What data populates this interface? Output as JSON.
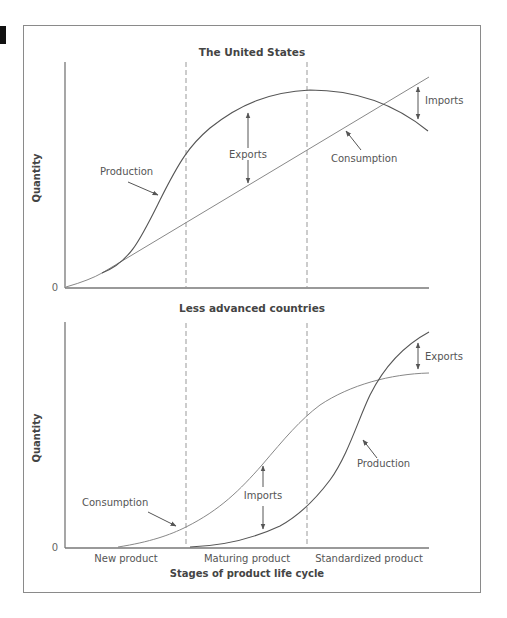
{
  "figure": {
    "top_panel": {
      "title": "The United States",
      "y_label": "Quantity",
      "origin_label": "0",
      "labels": {
        "production": "Production",
        "consumption": "Consumption",
        "exports": "Exports",
        "imports": "Imports"
      }
    },
    "bottom_panel": {
      "title": "Less advanced countries",
      "y_label": "Quantity",
      "origin_label": "0",
      "labels": {
        "production": "Production",
        "consumption": "Consumption",
        "exports": "Exports",
        "imports": "Imports"
      }
    },
    "x_axis": {
      "title": "Stages of product life cycle",
      "stages": [
        "New product",
        "Maturing product",
        "Standardized product"
      ]
    }
  },
  "colors": {
    "frame": "#8a8a8a",
    "production": "#555555",
    "consumption": "#888888",
    "text": "#444444"
  }
}
